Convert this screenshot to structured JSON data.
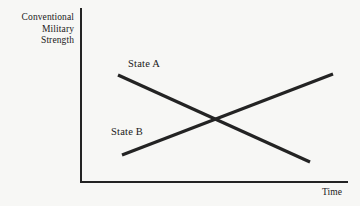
{
  "figure": {
    "background_color": "#f7f7f5",
    "ink_color": "#232323"
  },
  "axes": {
    "y_title": "Conventional\nMilitary\nStrength",
    "x_title": "Time"
  },
  "chart_data": {
    "type": "line",
    "title": "",
    "subtitle": "",
    "xlabel": "Time",
    "ylabel": "Conventional Military Strength",
    "grid": false,
    "legend": "inline-labels",
    "xlim": [
      0,
      100
    ],
    "ylim": [
      0,
      100
    ],
    "axis_ticks": {
      "x": [],
      "y": []
    },
    "annotations": [
      {
        "text": "State A",
        "x": 19,
        "y": 74,
        "note": "label sits above the left end of the declining line"
      },
      {
        "text": "State B",
        "x": 13,
        "y": 35,
        "note": "label sits above the left end of the rising line"
      },
      {
        "text": "crossover",
        "x": 52,
        "y": 43,
        "note": "the two trend lines intersect near the middle of the plot"
      }
    ],
    "series": [
      {
        "name": "State A",
        "trend": "decreasing",
        "x": [
          14,
          86
        ],
        "values": [
          64,
          15
        ],
        "points": [
          {
            "x": 14,
            "y": 64
          },
          {
            "x": 86,
            "y": 15
          }
        ]
      },
      {
        "name": "State B",
        "trend": "increasing",
        "x": [
          16,
          95
        ],
        "values": [
          20,
          66
        ],
        "points": [
          {
            "x": 16,
            "y": 20
          },
          {
            "x": 95,
            "y": 66
          }
        ]
      }
    ],
    "pixel_geometry": {
      "origin": [
        80,
        182
      ],
      "x_axis_end": [
        348,
        182
      ],
      "y_axis_top": [
        80,
        8
      ],
      "series": [
        {
          "name": "State A",
          "x1": 118,
          "y1": 75,
          "x2": 310,
          "y2": 162
        },
        {
          "name": "State B",
          "x1": 122,
          "y1": 155,
          "x2": 333,
          "y2": 74
        }
      ],
      "crossing_point": [
        218,
        118
      ]
    }
  },
  "series_labels": {
    "a": "State A",
    "b": "State B"
  }
}
